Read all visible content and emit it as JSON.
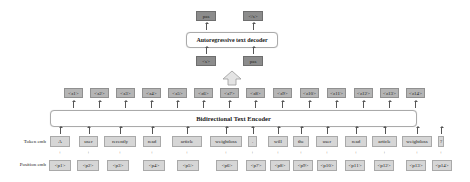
{
  "decoder": {
    "label": "Autoregressive text decoder",
    "outputs": [
      "pas",
      "</s>"
    ],
    "inputs": [
      "<s>",
      "pas"
    ]
  },
  "encoder": {
    "label": "Bidirectional Text Encoder"
  },
  "row_labels": {
    "token": "Token emb",
    "position": "Position emb"
  },
  "latents": [
    "<z1>",
    "<z2>",
    "<z3>",
    "<z4>",
    "<z5>",
    "<z6>",
    "<z7>",
    "<z8>",
    "<z9>",
    "<z10>",
    "<z11>",
    "<z12>",
    "<z13>",
    "<z14>"
  ],
  "tokens": [
    "A",
    "user",
    "recently",
    "read",
    "article",
    "weightloss",
    ".",
    "will",
    "the",
    "user",
    "read",
    "article",
    "weightloss",
    "?"
  ],
  "positions": [
    "<p1>",
    "<p2>",
    "<p3>",
    "<p4>",
    "<p5>",
    "<p6>",
    "<p7>",
    "<p8>",
    "<p9>",
    "<p10>",
    "<p11>",
    "<p12>",
    "<p13>",
    "<p14>"
  ],
  "plus_symbol": "+"
}
